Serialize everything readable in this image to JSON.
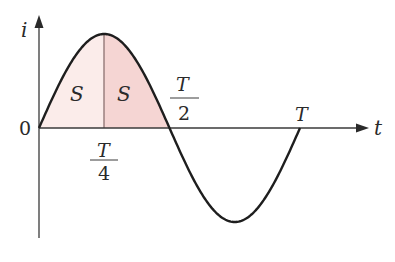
{
  "chart_data": {
    "type": "line",
    "title": "",
    "xlabel": "t",
    "ylabel": "i",
    "function": "i = sin(2πt/T)",
    "x_ticks": [
      "0",
      "T/4",
      "T/2",
      "T"
    ],
    "x": [
      0,
      0.125,
      0.25,
      0.375,
      0.5,
      0.625,
      0.75,
      0.875,
      1.0
    ],
    "series": [
      {
        "name": "i(t)",
        "values": [
          0,
          0.707,
          1,
          0.707,
          0,
          -0.707,
          -1,
          -0.707,
          0
        ]
      }
    ],
    "shaded_regions": [
      {
        "label": "S",
        "from": "0",
        "to": "T/4",
        "color": "#fbecea"
      },
      {
        "label": "S",
        "from": "T/4",
        "to": "T/2",
        "color": "#f5d5d3"
      }
    ],
    "grid": false,
    "legend": "none"
  },
  "labels": {
    "y_axis": "i",
    "x_axis": "t",
    "origin": "0",
    "area_left": "S",
    "area_right": "S",
    "quarter_num": "T",
    "quarter_den": "4",
    "half_num": "T",
    "half_den": "2",
    "period": "T"
  },
  "colors": {
    "curve": "#1e1e1e",
    "axis": "#3a3a3a",
    "fill_light": "#fbecea",
    "fill_dark": "#f5d5d3"
  }
}
